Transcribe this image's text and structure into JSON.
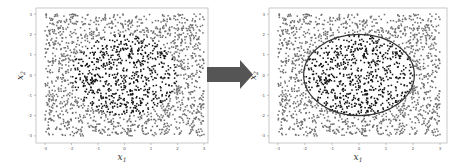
{
  "arrow": {
    "color": "#555555",
    "direction": "right"
  },
  "colors": {
    "inner_points": "#111111",
    "outer_points": "#6e6e6e",
    "boundary": "#333333",
    "frame": "#bbbbbb"
  },
  "chart_data": [
    {
      "type": "scatter",
      "title": "",
      "xlabel": "x1",
      "ylabel": "x2",
      "xlim": [
        -3.3,
        3.3
      ],
      "ylim": [
        -3.3,
        3.3
      ],
      "xticks": [
        "-3",
        "-2",
        "-1",
        "0",
        "1",
        "2",
        "3"
      ],
      "yticks": [
        "3",
        "2",
        "1",
        "0",
        "-1",
        "-2",
        "-3"
      ],
      "grid": false,
      "legend": null,
      "series": [
        {
          "name": "inside circle (class 1)",
          "distribution": "uniform in square [-3,3]^2 with x1^2 + x2^2 < 4",
          "approx_count": 700,
          "color": "#111111"
        },
        {
          "name": "outside circle (class 0)",
          "distribution": "uniform in square [-3,3]^2 with x1^2 + x2^2 >= 4",
          "approx_count": 1300,
          "color": "#6e6e6e"
        }
      ],
      "decision_boundary": null
    },
    {
      "type": "scatter",
      "title": "",
      "xlabel": "x1",
      "ylabel": "x2",
      "xlim": [
        -3.3,
        3.3
      ],
      "ylim": [
        -3.3,
        3.3
      ],
      "xticks": [
        "-3",
        "-2",
        "-1",
        "0",
        "1",
        "2",
        "3"
      ],
      "yticks": [
        "3",
        "2",
        "1",
        "0",
        "-1",
        "-2",
        "-3"
      ],
      "grid": false,
      "legend": null,
      "series": [
        {
          "name": "inside circle (class 1)",
          "distribution": "uniform in square [-3,3]^2 with x1^2 + x2^2 < 4",
          "approx_count": 700,
          "color": "#111111"
        },
        {
          "name": "outside circle (class 0)",
          "distribution": "uniform in square [-3,3]^2 with x1^2 + x2^2 >= 4",
          "approx_count": 1300,
          "color": "#6e6e6e"
        }
      ],
      "decision_boundary": {
        "shape": "closed curve (approx. circle)",
        "center": [
          0,
          0
        ],
        "radius_x": 2.05,
        "radius_y": 2.0,
        "color": "#333333"
      }
    }
  ]
}
